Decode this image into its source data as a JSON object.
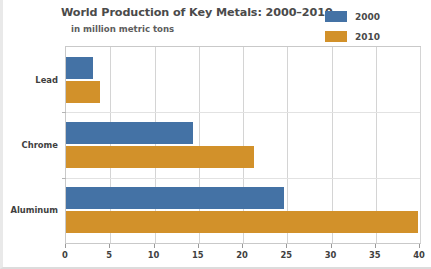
{
  "chart_data": {
    "type": "bar",
    "orientation": "horizontal",
    "title": "World Production of Key Metals: 2000–2010",
    "subtitle": "in million metric tons",
    "xlabel": "",
    "ylabel": "",
    "categories": [
      "Lead",
      "Chrome",
      "Aluminum"
    ],
    "series": [
      {
        "name": "2000",
        "color": "#4472a5",
        "values": [
          3.1,
          14.3,
          24.6
        ]
      },
      {
        "name": "2010",
        "color": "#d2912a",
        "values": [
          3.8,
          21.2,
          39.8
        ]
      }
    ],
    "xlim": [
      0,
      40
    ],
    "xticks": [
      0,
      5,
      10,
      15,
      20,
      25,
      30,
      35,
      40
    ],
    "xtick_labels": [
      "0",
      "5",
      "10",
      "15",
      "20",
      "25",
      "30",
      "35",
      "40"
    ],
    "grid": "vertical",
    "legend_position": "top-right"
  },
  "legend": {
    "items": [
      {
        "label": "2000",
        "color": "#4472a5"
      },
      {
        "label": "2010",
        "color": "#d2912a"
      }
    ]
  },
  "colors": {
    "series_2000": "#4472a5",
    "series_2010": "#d2912a",
    "gridline": "#d4d4d4",
    "plot_border": "#c9c9c9",
    "text": "#4a4a4a"
  }
}
